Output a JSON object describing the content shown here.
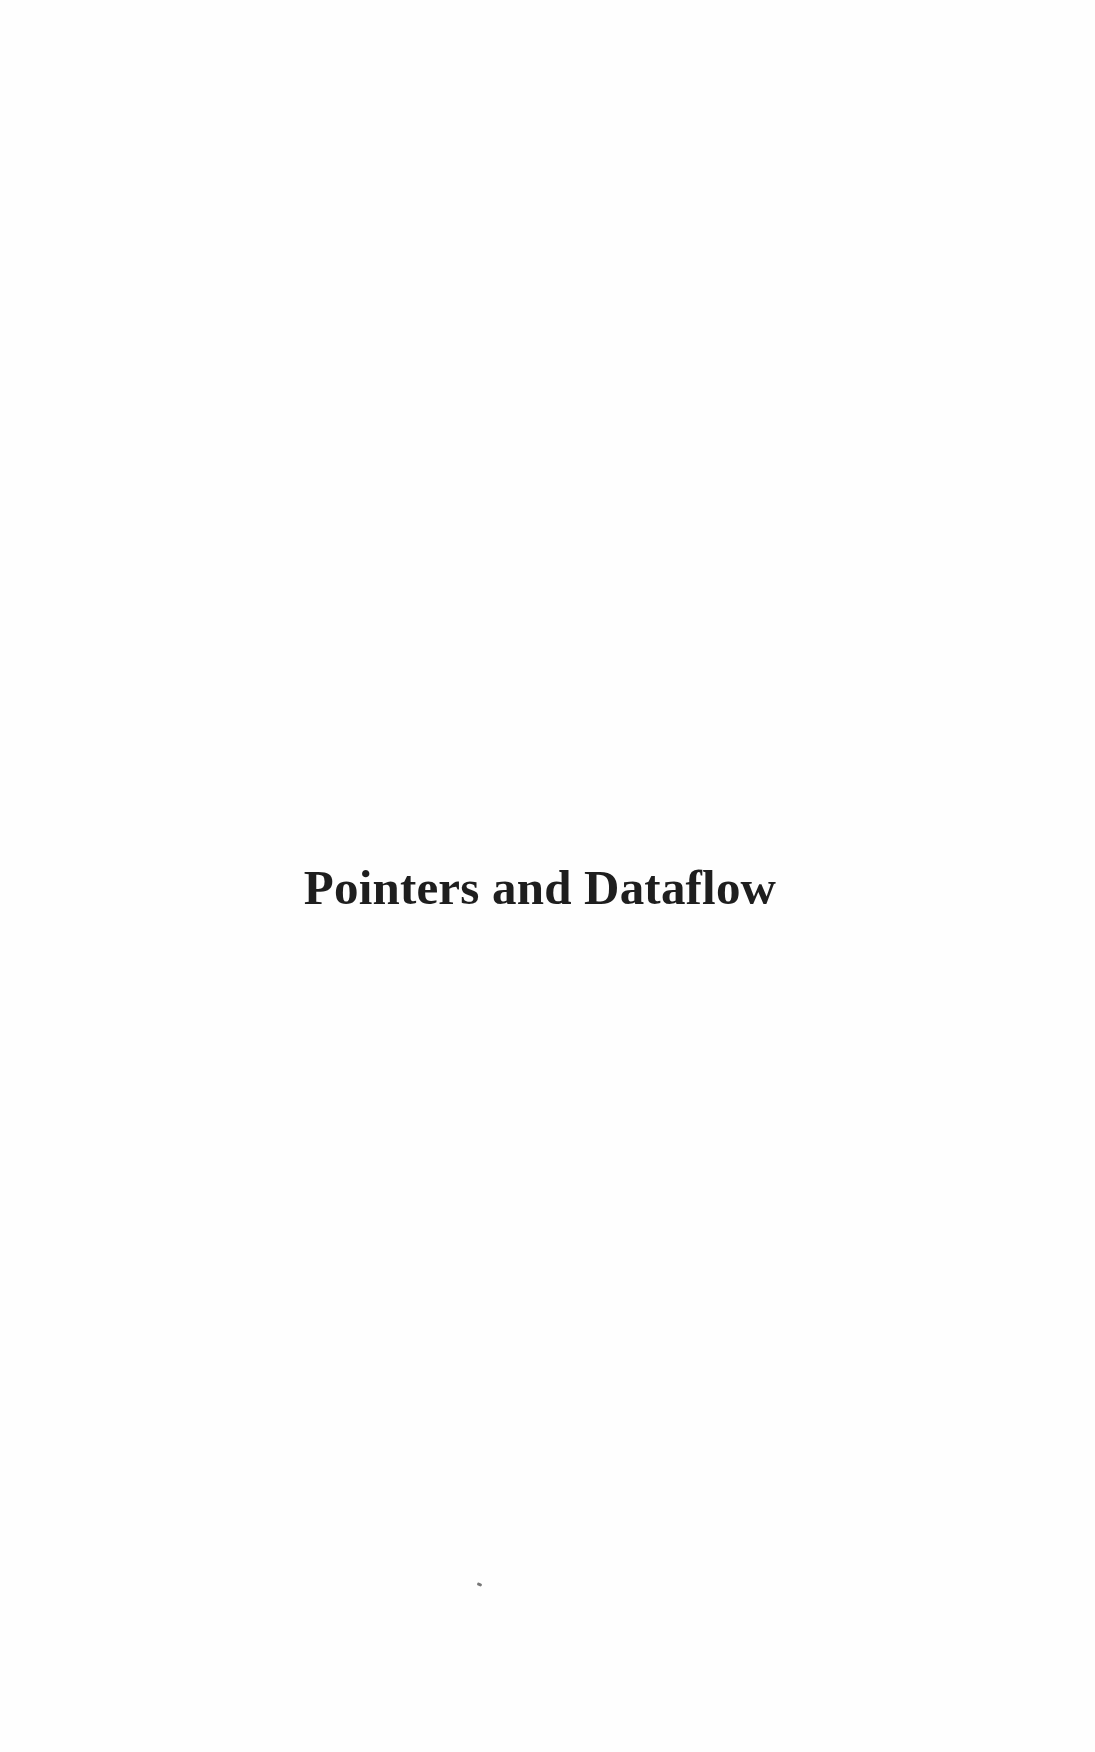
{
  "page": {
    "title": "Pointers and Dataflow"
  }
}
